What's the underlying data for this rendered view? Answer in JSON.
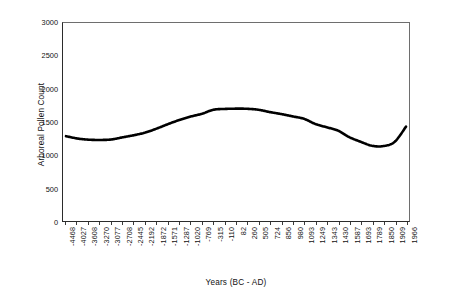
{
  "chart_data": {
    "type": "line",
    "title": "",
    "xlabel": "Years (BC - AD)",
    "ylabel": "Arboreal Pollen Count",
    "ylim": [
      0,
      3000
    ],
    "ytick_labels": [
      "0",
      "500",
      "1000",
      "1500",
      "2000",
      "2500",
      "3000"
    ],
    "ytick_values": [
      0,
      500,
      1000,
      1500,
      2000,
      2500,
      3000
    ],
    "grid": false,
    "legend": "none",
    "categories": [
      "-4468",
      "-4027",
      "-3608",
      "-3270",
      "-3077",
      "-2708",
      "-2445",
      "-2192",
      "-1872",
      "-1571",
      "-1287",
      "-1020",
      "-769",
      "-315",
      "-110",
      "82",
      "260",
      "505",
      "724",
      "856",
      "980",
      "1093",
      "1249",
      "1343",
      "1430",
      "1587",
      "1693",
      "1789",
      "1850",
      "1909",
      "1966"
    ],
    "values": [
      1285,
      1250,
      1232,
      1228,
      1235,
      1268,
      1300,
      1340,
      1400,
      1468,
      1530,
      1582,
      1625,
      1685,
      1698,
      1702,
      1700,
      1685,
      1650,
      1620,
      1585,
      1548,
      1470,
      1420,
      1370,
      1270,
      1200,
      1140,
      1135,
      1200,
      1430
    ]
  },
  "caption": {
    "text": ""
  }
}
